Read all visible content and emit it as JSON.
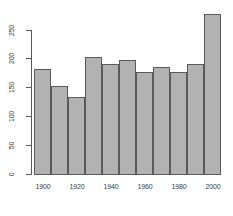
{
  "chart_data": {
    "type": "bar",
    "title": "",
    "subtitle": "",
    "xlabel": "",
    "ylabel": "",
    "categories": [
      "1900",
      "1910",
      "1920",
      "1930",
      "1940",
      "1950",
      "1960",
      "1970",
      "1980",
      "1990",
      "2000"
    ],
    "values": [
      183,
      153,
      135,
      203,
      192,
      199,
      178,
      186,
      177,
      191,
      278
    ],
    "ylim": [
      0,
      280
    ],
    "yticks": [
      "0",
      "50",
      "100",
      "150",
      "200",
      "250"
    ],
    "ytick_values": [
      0,
      50,
      100,
      150,
      200,
      250
    ],
    "xticks": [
      "1900",
      "1920",
      "1940",
      "1960",
      "1980",
      "2000"
    ],
    "xtick_values": [
      1900,
      1920,
      1940,
      1960,
      1980,
      2000
    ],
    "grid": false,
    "legend": null,
    "bar_fill_color": "#b2b2b2",
    "bar_border_color": "#5a5a5a",
    "axis_color": "#5a5a5a",
    "background_color": "#ffffff"
  }
}
